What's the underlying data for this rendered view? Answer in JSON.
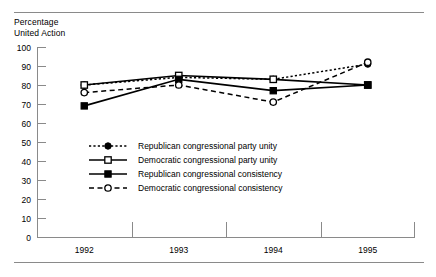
{
  "chart_data": {
    "type": "line",
    "title": "",
    "ylabel": "Percentage\nUnited Action",
    "xlabel": "",
    "categories": [
      "1992",
      "1993",
      "1994",
      "1995"
    ],
    "ylim": [
      0,
      100
    ],
    "yticks": [
      0,
      10,
      20,
      30,
      40,
      50,
      60,
      70,
      80,
      90,
      100
    ],
    "grid": false,
    "legend_position": "inside-lower-left",
    "series": [
      {
        "name": "Republican congressional party unity",
        "marker": "filled-circle",
        "line": "dotted",
        "values": [
          80,
          84,
          83,
          91
        ]
      },
      {
        "name": "Democratic congressional party unity",
        "marker": "open-square",
        "line": "solid",
        "values": [
          80,
          85,
          83,
          80
        ]
      },
      {
        "name": "Republican congressional consistency",
        "marker": "filled-square",
        "line": "solid",
        "values": [
          69,
          83,
          77,
          80
        ]
      },
      {
        "name": "Democratic congressional consistency",
        "marker": "open-circle",
        "line": "dashed",
        "values": [
          76,
          80,
          71,
          92
        ]
      }
    ]
  },
  "axis": {
    "y_label_text": "Percentage\nUnited Action"
  },
  "legend": {
    "items": [
      {
        "label": "Republican congressional party unity"
      },
      {
        "label": "Democratic congressional party unity"
      },
      {
        "label": "Republican congressional consistency"
      },
      {
        "label": "Democratic congressional consistency"
      }
    ]
  },
  "colors": {
    "ink": "#000000",
    "axis": "#8a8a8a",
    "background": "#ffffff"
  }
}
